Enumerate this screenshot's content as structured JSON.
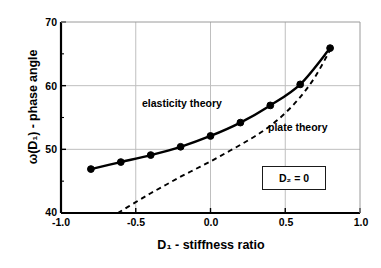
{
  "chart_data": {
    "type": "line",
    "title": "",
    "xlabel": "D₁ - stiffness ratio",
    "ylabel": "ω(D₁) - phase angle",
    "xlim": [
      -1.0,
      1.0
    ],
    "ylim": [
      40,
      70
    ],
    "xticks": [
      -1.0,
      -0.5,
      0.0,
      0.5,
      1.0
    ],
    "xticklabels": [
      "-1.0",
      "-0.5",
      "0.0",
      "0.5",
      "1.0"
    ],
    "yticks": [
      40,
      50,
      60,
      70
    ],
    "yticklabels": [
      "40",
      "50",
      "60",
      "70"
    ],
    "yminorticks": [
      45,
      55,
      65
    ],
    "grid": true,
    "grid_color": "#bfbfbf",
    "frame_color": "#000000",
    "legend_position": "inline-annotations",
    "series": [
      {
        "name": "elasticity theory",
        "style": "solid-with-markers",
        "color": "#000000",
        "marker": "circle",
        "x": [
          -0.8,
          -0.6,
          -0.4,
          -0.2,
          0.0,
          0.2,
          0.4,
          0.6,
          0.8
        ],
        "values": [
          46.9,
          48.0,
          49.1,
          50.4,
          52.1,
          54.2,
          56.9,
          60.2,
          65.9
        ]
      },
      {
        "name": "plate theory",
        "style": "dashed",
        "color": "#000000",
        "marker": "none",
        "x": [
          -0.62,
          -0.5,
          -0.4,
          -0.3,
          -0.2,
          -0.1,
          0.0,
          0.1,
          0.2,
          0.3,
          0.4,
          0.5,
          0.6,
          0.7,
          0.8
        ],
        "values": [
          40.0,
          41.7,
          43.1,
          44.4,
          45.7,
          46.9,
          48.1,
          49.4,
          50.7,
          52.1,
          53.7,
          55.7,
          58.2,
          61.4,
          65.6
        ]
      }
    ],
    "annotations": [
      {
        "id": "elasticity",
        "text": "elasticity theory"
      },
      {
        "id": "plate",
        "text": "plate theory"
      },
      {
        "id": "d2box",
        "text": "D₂ = 0"
      }
    ]
  }
}
